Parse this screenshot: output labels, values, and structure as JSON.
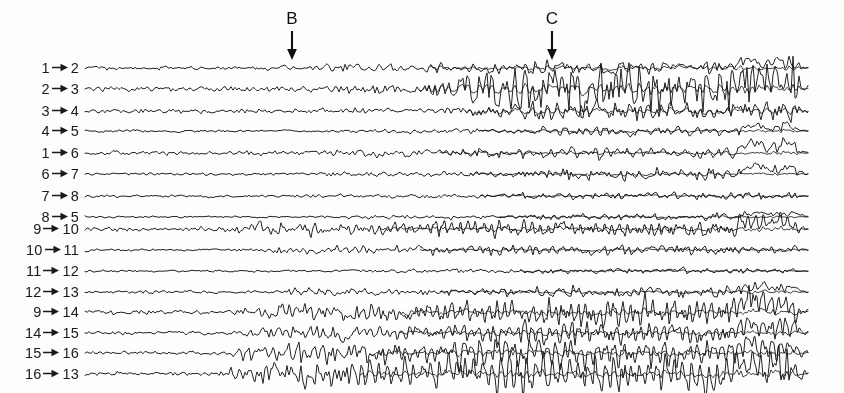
{
  "figure": {
    "background_color": "#fdfdfd",
    "trace_color": "#161616",
    "label_color": "#1a1a1a",
    "width": 844,
    "height": 393,
    "plot_left": 85,
    "plot_right": 808,
    "label_right_edge": 79,
    "first_baseline_y": 68,
    "channel_spacing": 20.5
  },
  "events": [
    {
      "name": "event-b",
      "letter": "B",
      "x": 292,
      "letter_y": 10,
      "arrow_top": 30,
      "arrow_bottom": 59
    },
    {
      "name": "event-c",
      "letter": "C",
      "x": 552,
      "letter_y": 10,
      "arrow_top": 30,
      "arrow_bottom": 59
    }
  ],
  "channels": [
    {
      "from": "1",
      "to": "2",
      "arrow": "→",
      "baseline_y": 68,
      "seed": 101,
      "base_amp": 1.5,
      "onset_x": 255,
      "onset_amp": 3.2,
      "build_x": 430,
      "build_amp": 4.6,
      "freq": 9.5,
      "noise": 1.5,
      "late_burst": true,
      "burst_x": 735,
      "burst_amp": 9.0,
      "rhythmic": 0.25
    },
    {
      "from": "2",
      "to": "3",
      "arrow": "→",
      "baseline_y": 89,
      "seed": 207,
      "base_amp": 1.3,
      "onset_x": 300,
      "onset_amp": 2.6,
      "build_x": 420,
      "build_amp": 11.5,
      "freq": 13.0,
      "noise": 3.6,
      "late_burst": true,
      "burst_x": 730,
      "burst_amp": 12.5,
      "rhythmic": 0.2
    },
    {
      "from": "3",
      "to": "4",
      "arrow": "→",
      "baseline_y": 111,
      "seed": 311,
      "base_amp": 1.6,
      "onset_x": 300,
      "onset_amp": 2.4,
      "build_x": 465,
      "build_amp": 6.8,
      "freq": 12.0,
      "noise": 2.6,
      "late_burst": false,
      "burst_x": 745,
      "burst_amp": 5.0,
      "rhythmic": 0.2
    },
    {
      "from": "4",
      "to": "5",
      "arrow": "→",
      "baseline_y": 131,
      "seed": 419,
      "base_amp": 1.0,
      "onset_x": 330,
      "onset_amp": 1.8,
      "build_x": 480,
      "build_amp": 3.2,
      "freq": 10.0,
      "noise": 1.2,
      "late_burst": true,
      "burst_x": 740,
      "burst_amp": 5.5,
      "rhythmic": 0.3
    },
    {
      "from": "1",
      "to": "6",
      "arrow": "→",
      "baseline_y": 153,
      "seed": 523,
      "base_amp": 1.6,
      "onset_x": 280,
      "onset_amp": 3.0,
      "build_x": 440,
      "build_amp": 4.2,
      "freq": 9.0,
      "noise": 1.6,
      "late_burst": true,
      "burst_x": 738,
      "burst_amp": 11.0,
      "rhythmic": 0.3
    },
    {
      "from": "6",
      "to": "7",
      "arrow": "→",
      "baseline_y": 174,
      "seed": 631,
      "base_amp": 1.0,
      "onset_x": 300,
      "onset_amp": 2.0,
      "build_x": 470,
      "build_amp": 3.6,
      "freq": 11.0,
      "noise": 1.4,
      "late_burst": true,
      "burst_x": 742,
      "burst_amp": 7.0,
      "rhythmic": 0.25
    },
    {
      "from": "7",
      "to": "8",
      "arrow": "→",
      "baseline_y": 196,
      "seed": 743,
      "base_amp": 1.2,
      "onset_x": 310,
      "onset_amp": 1.9,
      "build_x": 480,
      "build_amp": 3.0,
      "freq": 10.5,
      "noise": 1.2,
      "late_burst": false,
      "burst_x": 745,
      "burst_amp": 4.0,
      "rhythmic": 0.2
    },
    {
      "from": "8",
      "to": "5",
      "arrow": "→",
      "baseline_y": 217,
      "seed": 857,
      "base_amp": 0.9,
      "onset_x": 330,
      "onset_amp": 1.6,
      "build_x": 500,
      "build_amp": 2.6,
      "freq": 10.0,
      "noise": 1.0,
      "late_burst": true,
      "burst_x": 744,
      "burst_amp": 5.0,
      "rhythmic": 0.25
    },
    {
      "from": "9",
      "to": "10",
      "arrow": "→",
      "baseline_y": 229,
      "seed": 967,
      "base_amp": 1.8,
      "onset_x": 205,
      "onset_amp": 5.0,
      "build_x": 380,
      "build_amp": 5.6,
      "freq": 12.5,
      "noise": 1.8,
      "late_burst": true,
      "burst_x": 737,
      "burst_amp": 9.5,
      "rhythmic": 0.5
    },
    {
      "from": "10",
      "to": "11",
      "arrow": "→",
      "baseline_y": 250,
      "seed": 1061,
      "base_amp": 1.1,
      "onset_x": 235,
      "onset_amp": 3.2,
      "build_x": 420,
      "build_amp": 3.4,
      "freq": 12.0,
      "noise": 1.2,
      "late_burst": false,
      "burst_x": 745,
      "burst_amp": 3.5,
      "rhythmic": 0.45
    },
    {
      "from": "11",
      "to": "12",
      "arrow": "→",
      "baseline_y": 271,
      "seed": 1151,
      "base_amp": 0.9,
      "onset_x": 330,
      "onset_amp": 1.6,
      "build_x": 520,
      "build_amp": 2.4,
      "freq": 11.0,
      "noise": 1.0,
      "late_burst": false,
      "burst_x": 750,
      "burst_amp": 3.0,
      "rhythmic": 0.2
    },
    {
      "from": "12",
      "to": "13",
      "arrow": "→",
      "baseline_y": 292,
      "seed": 1249,
      "base_amp": 1.3,
      "onset_x": 255,
      "onset_amp": 2.6,
      "build_x": 440,
      "build_amp": 3.8,
      "freq": 11.5,
      "noise": 1.5,
      "late_burst": true,
      "burst_x": 740,
      "burst_amp": 6.0,
      "rhythmic": 0.3
    },
    {
      "from": "9",
      "to": "14",
      "arrow": "→",
      "baseline_y": 312,
      "seed": 1361,
      "base_amp": 1.7,
      "onset_x": 225,
      "onset_amp": 6.5,
      "build_x": 400,
      "build_amp": 7.5,
      "freq": 13.5,
      "noise": 2.4,
      "late_burst": true,
      "burst_x": 733,
      "burst_amp": 11.0,
      "rhythmic": 0.6
    },
    {
      "from": "14",
      "to": "15",
      "arrow": "→",
      "baseline_y": 333,
      "seed": 1459,
      "base_amp": 1.4,
      "onset_x": 230,
      "onset_amp": 4.6,
      "build_x": 400,
      "build_amp": 6.2,
      "freq": 13.0,
      "noise": 2.0,
      "late_burst": true,
      "burst_x": 736,
      "burst_amp": 8.0,
      "rhythmic": 0.55
    },
    {
      "from": "15",
      "to": "16",
      "arrow": "→",
      "baseline_y": 353,
      "seed": 1553,
      "base_amp": 1.3,
      "onset_x": 215,
      "onset_amp": 6.0,
      "build_x": 370,
      "build_amp": 7.0,
      "freq": 12.0,
      "noise": 1.8,
      "late_burst": true,
      "burst_x": 735,
      "burst_amp": 8.5,
      "rhythmic": 0.7
    },
    {
      "from": "16",
      "to": "13",
      "arrow": "→",
      "baseline_y": 374,
      "seed": 1663,
      "base_amp": 1.4,
      "onset_x": 210,
      "onset_amp": 7.5,
      "build_x": 360,
      "build_amp": 8.5,
      "freq": 11.5,
      "noise": 2.2,
      "late_burst": true,
      "burst_x": 732,
      "burst_amp": 9.0,
      "rhythmic": 0.8
    }
  ],
  "chart_data": {
    "type": "line",
    "xlabel": "",
    "ylabel": "",
    "grid": false,
    "legend_position": "none",
    "x_range_px": [
      85,
      808
    ],
    "series": [
      {
        "name": "1→2",
        "baseline_y": 68
      },
      {
        "name": "2→3",
        "baseline_y": 89
      },
      {
        "name": "3→4",
        "baseline_y": 111
      },
      {
        "name": "4→5",
        "baseline_y": 131
      },
      {
        "name": "1→6",
        "baseline_y": 153
      },
      {
        "name": "6→7",
        "baseline_y": 174
      },
      {
        "name": "7→8",
        "baseline_y": 196
      },
      {
        "name": "8→5",
        "baseline_y": 217
      },
      {
        "name": "9→10",
        "baseline_y": 229
      },
      {
        "name": "10→11",
        "baseline_y": 250
      },
      {
        "name": "11→12",
        "baseline_y": 271
      },
      {
        "name": "12→13",
        "baseline_y": 292
      },
      {
        "name": "9→14",
        "baseline_y": 312
      },
      {
        "name": "14→15",
        "baseline_y": 333
      },
      {
        "name": "15→16",
        "baseline_y": 353
      },
      {
        "name": "16→13",
        "baseline_y": 374
      }
    ],
    "annotations": [
      {
        "label": "B",
        "x_px": 292
      },
      {
        "label": "C",
        "x_px": 552
      }
    ]
  }
}
